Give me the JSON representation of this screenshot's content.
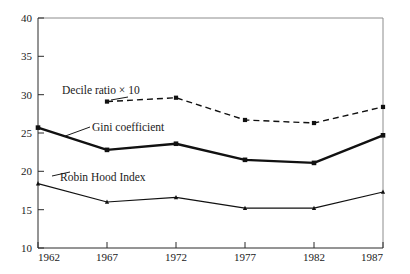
{
  "chart_data": {
    "type": "line",
    "title": "",
    "subtitle": "",
    "xlabel": "",
    "ylabel": "",
    "categories": [
      "1962",
      "1967",
      "1972",
      "1977",
      "1982",
      "1987"
    ],
    "x": [
      1962,
      1967,
      1972,
      1977,
      1982,
      1987
    ],
    "xlim": [
      1962,
      1987
    ],
    "ylim": [
      10,
      40
    ],
    "y_ticks": [
      "10",
      "15",
      "20",
      "25",
      "30",
      "35",
      "40"
    ],
    "x_ticks": [
      "1962",
      "1967",
      "1972",
      "1977",
      "1982",
      "1987"
    ],
    "grid": false,
    "legend_position": "inline-annotations",
    "series": [
      {
        "name": "Decile ratio × 10",
        "label": "Decile ratio × 10",
        "style": "dashed",
        "marker": "square",
        "color": "#111111",
        "x": [
          1967,
          1972,
          1977,
          1982,
          1987
        ],
        "values": [
          29.1,
          29.6,
          26.7,
          26.3,
          28.4
        ]
      },
      {
        "name": "Gini coefficient",
        "label": "Gini coefficient",
        "style": "solid-thick",
        "marker": "square",
        "color": "#111111",
        "x": [
          1962,
          1967,
          1972,
          1977,
          1982,
          1987
        ],
        "values": [
          25.7,
          22.8,
          23.6,
          21.5,
          21.1,
          24.7
        ]
      },
      {
        "name": "Robin Hood Index",
        "label": "Robin Hood Index",
        "style": "solid-thin",
        "marker": "triangle",
        "color": "#111111",
        "x": [
          1962,
          1967,
          1972,
          1977,
          1982,
          1987
        ],
        "values": [
          18.4,
          16.0,
          16.6,
          15.2,
          15.2,
          17.3
        ]
      }
    ],
    "annotations": [
      {
        "text": "Decile ratio × 10",
        "target_x": 1967,
        "target_y": 29.1
      },
      {
        "text": "Gini coefficient",
        "target_x": 1962,
        "target_y": 25.7
      },
      {
        "text": "Robin Hood Index",
        "target_x": 1962,
        "target_y": 18.4
      }
    ]
  },
  "axis": {
    "y_tick_40": "40",
    "y_tick_35": "35",
    "y_tick_30": "30",
    "y_tick_25": "25",
    "y_tick_20": "20",
    "y_tick_15": "15",
    "y_tick_10": "10",
    "x_tick_1": "1962",
    "x_tick_2": "1967",
    "x_tick_3": "1972",
    "x_tick_4": "1977",
    "x_tick_5": "1982",
    "x_tick_6": "1987"
  },
  "labels": {
    "decile": "Decile ratio × 10",
    "gini": "Gini coefficient",
    "robin_hood": "Robin Hood Index"
  }
}
